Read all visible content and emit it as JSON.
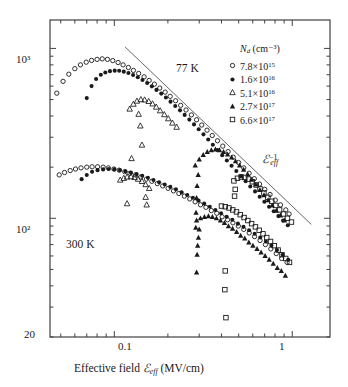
{
  "axes": {
    "x": {
      "label_prefix": "Effective field ",
      "label_symbol": "ℰ",
      "label_sub": "eff",
      "label_units": " (MV/cm)",
      "ticks": [
        "0.1",
        "1"
      ],
      "scale": "log",
      "range": [
        0.0435,
        1.63
      ]
    },
    "y": {
      "label_symbol": "μ",
      "label_sub": "eff",
      "label_units": " (cm²/V·s)",
      "ticks": [
        "10³",
        "10²",
        "20"
      ],
      "scale": "log",
      "range": [
        20,
        1470
      ]
    }
  },
  "legend": {
    "title_symbol": "N",
    "title_sub": "d",
    "title_units": " (cm⁻³)",
    "entries": [
      {
        "marker": "open-circle",
        "value": "7.8×10",
        "exp": "15"
      },
      {
        "marker": "filled-circle",
        "value": "1.6×10",
        "exp": "16"
      },
      {
        "marker": "open-triangle",
        "value": "5.1×10",
        "exp": "16"
      },
      {
        "marker": "filled-triangle",
        "value": "2.7×10",
        "exp": "17"
      },
      {
        "marker": "open-square",
        "value": "6.6×10",
        "exp": "17"
      }
    ]
  },
  "annotations": {
    "temp_77k": "77 K",
    "temp_300k": "300 K",
    "slope_symbol": "ℰ",
    "slope_sub": "eff",
    "slope_sup": "−1"
  },
  "colors": {
    "ink": "#1a1a1a",
    "frame": "#404040",
    "guide": "#555555"
  },
  "chart_data": {
    "type": "scatter",
    "title": "",
    "xlabel": "Effective field ℰeff (MV/cm)",
    "ylabel": "μeff (cm²/V·s)",
    "xscale": "log",
    "yscale": "log",
    "xlim": [
      0.0435,
      1.63
    ],
    "ylim": [
      20,
      1470
    ],
    "grid": false,
    "legend_position": "top-right",
    "guide_line": {
      "label": "ℰeff⁻¹",
      "slope": -1,
      "x": [
        0.115,
        1.28
      ],
      "y": [
        1020,
        92
      ]
    },
    "groups": [
      {
        "name": "77 K",
        "label": "77 K",
        "series": [
          {
            "name": "7.8×10^15",
            "marker": "open-circle",
            "x": [
              0.0475,
              0.0515,
              0.0555,
              0.06,
              0.0645,
              0.0695,
              0.0745,
              0.08,
              0.0855,
              0.0915,
              0.098,
              0.105,
              0.112,
              0.12,
              0.128,
              0.137,
              0.147,
              0.157,
              0.168,
              0.18,
              0.193,
              0.206,
              0.221,
              0.236,
              0.253,
              0.271,
              0.29,
              0.31,
              0.332,
              0.355,
              0.38,
              0.407,
              0.436,
              0.466,
              0.499,
              0.534,
              0.572,
              0.612,
              0.655,
              0.701,
              0.75,
              0.803,
              0.859,
              0.92,
              0.96
            ],
            "y": [
              545,
              640,
              705,
              760,
              800,
              830,
              850,
              862,
              868,
              862,
              848,
              826,
              800,
              772,
              742,
              712,
              680,
              648,
              616,
              584,
              553,
              522,
              492,
              462,
              434,
              406,
              380,
              354,
              330,
              307,
              286,
              266,
              247,
              229,
              213,
              198,
              184,
              171,
              159,
              148,
              138,
              128,
              120,
              112,
              106
            ]
          },
          {
            "name": "1.6×10^16",
            "marker": "filled-circle",
            "x": [
              0.07,
              0.0745,
              0.079,
              0.084,
              0.089,
              0.0945,
              0.1005,
              0.1065,
              0.113,
              0.12,
              0.1275,
              0.1355,
              0.144,
              0.153,
              0.1625,
              0.1725,
              0.1835,
              0.195,
              0.207,
              0.22,
              0.234,
              0.2485,
              0.264,
              0.2805,
              0.298,
              0.317,
              0.337,
              0.358,
              0.38,
              0.404,
              0.429,
              0.456,
              0.485,
              0.515,
              0.547,
              0.581,
              0.618,
              0.656,
              0.697,
              0.741,
              0.787,
              0.836,
              0.888,
              0.944
            ],
            "y": [
              510,
              600,
              660,
              700,
              722,
              735,
              740,
              738,
              730,
              716,
              698,
              676,
              652,
              626,
              598,
              570,
              542,
              514,
              486,
              458,
              432,
              406,
              381,
              357,
              334,
              312,
              291,
              271,
              252,
              235,
              219,
              204,
              190,
              177,
              165,
              154,
              144,
              134,
              125,
              117,
              110,
              103,
              97,
              91
            ]
          },
          {
            "name": "5.1×10^16",
            "marker": "open-triangle",
            "x": [
              0.122,
              0.128,
              0.134,
              0.141,
              0.148,
              0.156,
              0.164,
              0.172,
              0.181,
              0.191,
              0.201,
              0.212,
              0.224,
              0.137,
              0.14,
              0.143,
              0.125
            ],
            "y": [
              440,
              470,
              490,
              500,
              498,
              488,
              472,
              452,
              430,
              408,
              386,
              364,
              344,
              410,
              350,
              270,
              225
            ]
          },
          {
            "name": "2.7×10^17",
            "marker": "filled-triangle",
            "x": [
              0.285,
              0.3,
              0.316,
              0.333,
              0.351,
              0.37,
              0.39,
              0.411,
              0.433,
              0.456,
              0.48,
              0.506,
              0.533,
              0.562,
              0.592,
              0.624,
              0.658,
              0.694,
              0.732,
              0.772,
              0.814,
              0.858,
              0.905,
              0.296,
              0.292,
              0.29,
              0.288,
              0.287
            ],
            "y": [
              205,
              222,
              236,
              246,
              252,
              254,
              252,
              246,
              238,
              228,
              217,
              205,
              193,
              181,
              169,
              158,
              147,
              137,
              128,
              119,
              111,
              104,
              97,
              180,
              155,
              132,
              108,
              88
            ]
          },
          {
            "name": "6.6×10^17",
            "marker": "open-square",
            "x": [
              0.47,
              0.492,
              0.516,
              0.541,
              0.568,
              0.597,
              0.627,
              0.659,
              0.693,
              0.729,
              0.767,
              0.807,
              0.849,
              0.893,
              0.94,
              0.99,
              0.478,
              0.474
            ],
            "y": [
              166,
              172,
              175,
              174,
              170,
              164,
              157,
              149,
              141,
              133,
              126,
              119,
              112,
              106,
              100,
              95,
              148,
              135
            ]
          }
        ]
      },
      {
        "name": "300 K",
        "label": "300 K",
        "series": [
          {
            "name": "7.8×10^15",
            "marker": "open-circle",
            "x": [
              0.049,
              0.0525,
              0.0565,
              0.0605,
              0.065,
              0.07,
              0.075,
              0.0805,
              0.0865,
              0.0925,
              0.0995,
              0.1065,
              0.1145,
              0.1225,
              0.1315,
              0.141,
              0.1515,
              0.1625,
              0.1745,
              0.187,
              0.2005,
              0.215,
              0.2305,
              0.2475,
              0.2655,
              0.2845,
              0.305,
              0.327,
              0.351,
              0.3765,
              0.4035,
              0.433,
              0.464,
              0.498,
              0.534,
              0.573,
              0.614,
              0.659,
              0.707,
              0.758,
              0.813,
              0.872,
              0.935
            ],
            "y": [
              180,
              186,
              191,
              195,
              198,
              200,
              201,
              201,
              200,
              198,
              195,
              192,
              188,
              184,
              180,
              175,
              170,
              165,
              160,
              155,
              150,
              145,
              140,
              135,
              130,
              125,
              120,
              116,
              111,
              107,
              102,
              98,
              94,
              90,
              86,
              82,
              78,
              74,
              70,
              66,
              62,
              58,
              55
            ]
          },
          {
            "name": "1.6×10^16",
            "marker": "filled-circle",
            "x": [
              0.0655,
              0.07,
              0.075,
              0.0805,
              0.0865,
              0.093,
              0.1,
              0.1075,
              0.1155,
              0.124,
              0.1335,
              0.1435,
              0.1545,
              0.166,
              0.1785,
              0.192,
              0.2065,
              0.222,
              0.239,
              0.257,
              0.2765,
              0.2975,
              0.32,
              0.344,
              0.37,
              0.398,
              0.428,
              0.4605,
              0.495,
              0.532,
              0.572,
              0.615,
              0.661,
              0.711,
              0.764,
              0.821,
              0.883,
              0.949
            ],
            "y": [
              170,
              180,
              188,
              192,
              194,
              195,
              194,
              192,
              189,
              186,
              182,
              178,
              173,
              168,
              163,
              158,
              153,
              148,
              142,
              137,
              132,
              127,
              122,
              117,
              112,
              107,
              102,
              98,
              93,
              89,
              85,
              81,
              77,
              73,
              69,
              65,
              61,
              57
            ]
          },
          {
            "name": "5.1×10^16",
            "marker": "open-triangle",
            "x": [
              0.108,
              0.113,
              0.118,
              0.124,
              0.13,
              0.136,
              0.143,
              0.15,
              0.157,
              0.15,
              0.152,
              0.118
            ],
            "y": [
              168,
              172,
              175,
              176,
              174,
              170,
              165,
              158,
              150,
              133,
              120,
              122
            ]
          },
          {
            "name": "2.7×10^17",
            "marker": "filled-triangle",
            "x": [
              0.29,
              0.305,
              0.321,
              0.338,
              0.356,
              0.375,
              0.395,
              0.416,
              0.438,
              0.462,
              0.487,
              0.513,
              0.541,
              0.57,
              0.601,
              0.634,
              0.668,
              0.704,
              0.742,
              0.782,
              0.824,
              0.868,
              0.915,
              0.3,
              0.297,
              0.294,
              0.292,
              0.29
            ],
            "y": [
              97,
              100,
              102,
              103,
              102,
              100,
              97,
              94,
              90,
              87,
              83,
              79,
              76,
              72,
              69,
              66,
              63,
              60,
              57,
              54,
              51,
              49,
              46,
              86,
              77,
              69,
              61,
              48
            ]
          },
          {
            "name": "6.6×10^17",
            "marker": "open-square",
            "x": [
              0.4,
              0.42,
              0.441,
              0.463,
              0.486,
              0.51,
              0.536,
              0.563,
              0.591,
              0.621,
              0.652,
              0.685,
              0.719,
              0.755,
              0.793,
              0.833,
              0.875,
              0.919,
              0.965,
              0.42,
              0.418,
              0.424
            ],
            "y": [
              118,
              117,
              115,
              112,
              109,
              105,
              101,
              97,
              93,
              89,
              85,
              81,
              77,
              73,
              69,
              65,
              61,
              58,
              55,
              49,
              38,
              26
            ]
          }
        ]
      }
    ]
  }
}
